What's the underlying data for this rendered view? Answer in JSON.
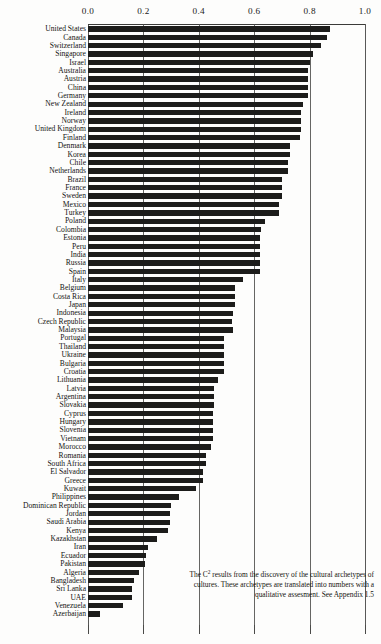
{
  "chart_data": {
    "type": "bar",
    "orientation": "horizontal",
    "title": "",
    "xlabel": "",
    "ylabel": "",
    "xlim": [
      0.0,
      1.0
    ],
    "grid": true,
    "legend": null,
    "ticks": [
      "0.0",
      "0.2",
      "0.4",
      "0.6",
      "0.8",
      "1.0"
    ],
    "tick_values": [
      0.0,
      0.2,
      0.4,
      0.6,
      0.8,
      1.0
    ],
    "categories": [
      "United States",
      "Canada",
      "Switzerland",
      "Singapore",
      "Israel",
      "Australia",
      "Austria",
      "China",
      "Germany",
      "New Zealand",
      "Ireland",
      "Norway",
      "United Kingdom",
      "Finland",
      "Denmark",
      "Korea",
      "Chile",
      "Netherlands",
      "Brazil",
      "France",
      "Sweden",
      "Mexico",
      "Turkey",
      "Poland",
      "Colombia",
      "Estonia",
      "Peru",
      "India",
      "Russia",
      "Spain",
      "Italy",
      "Belgium",
      "Costa Rica",
      "Japan",
      "Indonesia",
      "Czech Republic",
      "Malaysia",
      "Portugal",
      "Thailand",
      "Ukraine",
      "Bulgaria",
      "Croatia",
      "Lithuania",
      "Latvia",
      "Argentina",
      "Slovakia",
      "Cyprus",
      "Hungary",
      "Slovenia",
      "Vietnam",
      "Morocco",
      "Romania",
      "South Africa",
      "El Salvador",
      "Greece",
      "Kuwait",
      "Philippines",
      "Dominican Republic",
      "Jordan",
      "Saudi Arabia",
      "Kenya",
      "Kazakhstan",
      "Iran",
      "Ecuador",
      "Pakistan",
      "Algeria",
      "Bangladesh",
      "Sri Lanka",
      "UAE",
      "Venezuela",
      "Azerbaijan"
    ],
    "values": [
      0.873,
      0.862,
      0.84,
      0.812,
      0.8,
      0.793,
      0.793,
      0.793,
      0.793,
      0.775,
      0.77,
      0.77,
      0.77,
      0.767,
      0.73,
      0.728,
      0.722,
      0.722,
      0.7,
      0.7,
      0.7,
      0.69,
      0.69,
      0.64,
      0.625,
      0.62,
      0.62,
      0.62,
      0.62,
      0.62,
      0.56,
      0.53,
      0.53,
      0.53,
      0.525,
      0.52,
      0.525,
      0.49,
      0.49,
      0.49,
      0.49,
      0.49,
      0.47,
      0.455,
      0.455,
      0.455,
      0.45,
      0.45,
      0.45,
      0.45,
      0.445,
      0.425,
      0.425,
      0.415,
      0.415,
      0.39,
      0.33,
      0.3,
      0.295,
      0.295,
      0.29,
      0.25,
      0.215,
      0.21,
      0.205,
      0.185,
      0.165,
      0.16,
      0.16,
      0.128,
      0.045
    ]
  },
  "caption": {
    "line1_pre": "The C",
    "line1_sup": "2",
    "text": "The C² results from the discovery of the cultural archetypes of cultures. These archetypes are translated into numbers with a qualitative assesment. See Appendix 1.5",
    "body": " results from the discovery of the cultural archetypes of cultures. These archetypes are translated into numbers with a qualitative assesment. See Appendix 1.5"
  },
  "colors": {
    "bar": "#1c1c1a",
    "grid": "#4a4a48",
    "text": "#141412",
    "background": "#fdfdfc"
  }
}
